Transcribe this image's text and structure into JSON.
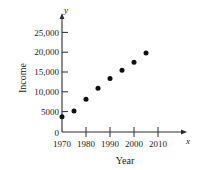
{
  "figure": {
    "scan_artifact_text": "",
    "background_color": "#ffffff",
    "ink_color": "#111111"
  },
  "chart_data": {
    "type": "scatter",
    "title": "",
    "xlabel": "Year",
    "ylabel": "Income",
    "x_axis_variable": "x",
    "y_axis_variable": "y",
    "x": [
      1970,
      1975,
      1980,
      1985,
      1990,
      1995,
      2000,
      2005
    ],
    "values": [
      3800,
      5300,
      8200,
      11000,
      13400,
      15500,
      17500,
      19800
    ],
    "xlim": [
      1970,
      2013
    ],
    "ylim": [
      0,
      27000
    ],
    "x_ticks": [
      1970,
      1980,
      1990,
      2000,
      2010
    ],
    "x_tick_labels": [
      "1970",
      "1980",
      "1990",
      "2000",
      "2010"
    ],
    "y_ticks": [
      0,
      5000,
      10000,
      15000,
      20000,
      25000
    ],
    "y_tick_labels": [
      "0",
      "5000",
      "10,000",
      "15,000",
      "20,000",
      "25,000"
    ],
    "grid": false,
    "legend": null,
    "marker": "filled-circle",
    "marker_color": "#111111"
  },
  "labels": {
    "y_tick_25000": "25,000",
    "y_tick_20000": "20,000",
    "y_tick_15000": "15,000",
    "y_tick_10000": "10,000",
    "y_tick_5000": "5000",
    "y_tick_0": "0",
    "x_tick_1970": "1970",
    "x_tick_1980": "1980",
    "x_tick_1990": "1990",
    "x_tick_2000": "2000",
    "x_tick_2010": "2010",
    "x_var": "x",
    "y_var": "y",
    "x_title": "Year",
    "y_title": "Income"
  }
}
